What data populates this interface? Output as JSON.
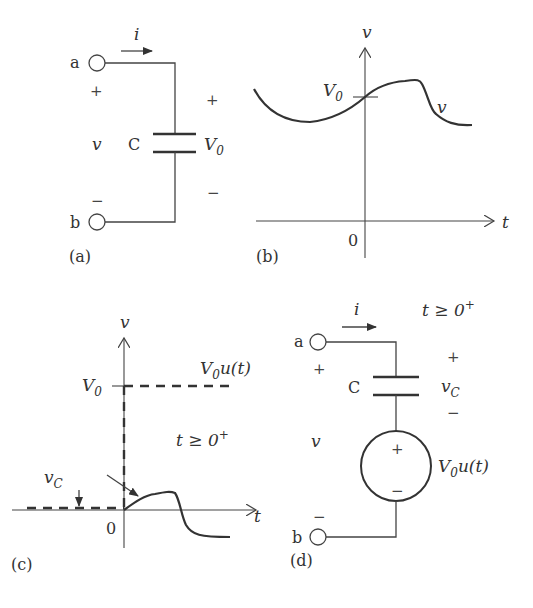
{
  "panel_a": {
    "caption": "(a)",
    "terminal_a": "a",
    "terminal_b": "b",
    "current": "i",
    "plus_left": "+",
    "minus_left": "−",
    "voltage_left": "v",
    "capacitor": "C",
    "plus_right": "+",
    "minus_right": "−",
    "initial_voltage": "V",
    "initial_voltage_sub": "0"
  },
  "panel_b": {
    "caption": "(b)",
    "y_axis_label": "v",
    "x_axis_label": "t",
    "origin_label": "0",
    "level_label": "V",
    "level_label_sub": "0",
    "curve_label": "v"
  },
  "panel_c": {
    "caption": "(c)",
    "y_axis_label": "v",
    "x_axis_label": "t",
    "origin_label": "0",
    "level_label": "V",
    "level_label_sub": "0",
    "step_label": "V",
    "step_label_sub": "0",
    "step_label_rest": "u(t)",
    "condition": "t ≥ 0",
    "condition_sup": "+",
    "vc_label": "v",
    "vc_label_sub": "C"
  },
  "panel_d": {
    "caption": "(d)",
    "terminal_a": "a",
    "terminal_b": "b",
    "current": "i",
    "condition": "t ≥ 0",
    "condition_sup": "+",
    "plus_left": "+",
    "minus_left": "−",
    "voltage_left": "v",
    "capacitor": "C",
    "vc_plus": "+",
    "vc_minus": "−",
    "vc_label": "v",
    "vc_label_sub": "C",
    "source_plus": "+",
    "source_minus": "−",
    "source_label": "V",
    "source_label_sub": "0",
    "source_label_rest": "u(t)"
  }
}
